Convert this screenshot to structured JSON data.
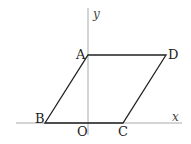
{
  "diagram": {
    "type": "parallelogram-on-coordinate-plane",
    "axes": {
      "x_label": "x",
      "y_label": "y",
      "origin_label": "O",
      "color": "#aaaaaa"
    },
    "points": {
      "A": {
        "label": "A",
        "position": "on y-axis"
      },
      "B": {
        "label": "B",
        "position": "on x-axis, left of origin"
      },
      "C": {
        "label": "C",
        "position": "on x-axis, right of origin"
      },
      "D": {
        "label": "D",
        "position": "upper right"
      }
    },
    "shape": {
      "name": "parallelogram ABCD",
      "edges": [
        "AD",
        "DC",
        "CB",
        "BA"
      ],
      "stroke_color": "#222222"
    }
  }
}
